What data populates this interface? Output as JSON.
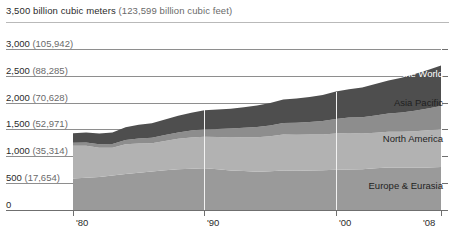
{
  "header": {
    "units_primary": "3,500 billion cubic meters",
    "units_secondary": "(123,599 billion cubic feet)"
  },
  "axis": {
    "y_labels": [
      {
        "value": 3000,
        "text": "3,000",
        "paren": "(105,942)"
      },
      {
        "value": 2500,
        "text": "2,500",
        "paren": "(88,285)"
      },
      {
        "value": 2000,
        "text": "2,000",
        "paren": "(70,628)"
      },
      {
        "value": 1500,
        "text": "1,500",
        "paren": "(52,971)"
      },
      {
        "value": 1000,
        "text": "1,000",
        "paren": "(35,314)"
      },
      {
        "value": 500,
        "text": "500",
        "paren": "(17,654)"
      },
      {
        "value": 0,
        "text": "0",
        "paren": ""
      }
    ],
    "x_labels": [
      {
        "year": 1980,
        "text": "'80"
      },
      {
        "year": 1990,
        "text": "'90"
      },
      {
        "year": 2000,
        "text": "'00"
      },
      {
        "year": 2008,
        "text": "'08"
      }
    ]
  },
  "series_labels": {
    "rest_of_world_line1": "Rest of",
    "rest_of_world_line2": "the World",
    "asia_pacific": "Asia Pacific",
    "north_america": "North America",
    "europe_eurasia": "Europe & Eurasia"
  },
  "colors": {
    "rest_of_world": "#4e4e4e",
    "asia_pacific": "#8d8d8d",
    "north_america": "#b2b2b2",
    "europe_eurasia": "#9a9a9a",
    "gridline": "#8e8e8e",
    "axis": "#6f6f6f",
    "background": "#ffffff"
  },
  "chart_data": {
    "type": "area",
    "title": "3,500 billion cubic meters (123,599 billion cubic feet)",
    "subtitle": "",
    "xlabel": "",
    "ylabel": "billion cubic meters",
    "stacked": true,
    "grid": true,
    "legend": "inline-right",
    "xlim": [
      1980,
      2008
    ],
    "ylim": [
      0,
      3500
    ],
    "yticks": [
      0,
      500,
      1000,
      1500,
      2000,
      2500,
      3000,
      3500
    ],
    "ytick_labels": [
      "0",
      "500 (17,654)",
      "1,000 (35,314)",
      "1,500 (52,971)",
      "2,000 (70,628)",
      "2,500 (88,285)",
      "3,000 (105,942)",
      "3,500 (123,599)"
    ],
    "xticks": [
      1980,
      1990,
      2000,
      2008
    ],
    "xtick_labels": [
      "'80",
      "'90",
      "'00",
      "'08"
    ],
    "x": [
      1980,
      1981,
      1982,
      1983,
      1984,
      1985,
      1986,
      1987,
      1988,
      1989,
      1990,
      1991,
      1992,
      1993,
      1994,
      1995,
      1996,
      1997,
      1998,
      1999,
      2000,
      2001,
      2002,
      2003,
      2004,
      2005,
      2006,
      2007,
      2008
    ],
    "series": [
      {
        "name": "Europe & Eurasia",
        "color": "#9a9a9a",
        "values": [
          585,
          600,
          615,
          640,
          670,
          695,
          715,
          740,
          760,
          770,
          775,
          760,
          735,
          725,
          710,
          720,
          735,
          730,
          735,
          740,
          750,
          755,
          760,
          775,
          790,
          790,
          790,
          790,
          800
        ]
      },
      {
        "name": "North America",
        "color": "#b2b2b2",
        "values": [
          610,
          595,
          545,
          520,
          555,
          545,
          530,
          545,
          565,
          580,
          590,
          600,
          615,
          630,
          645,
          655,
          670,
          670,
          670,
          665,
          675,
          680,
          665,
          665,
          665,
          665,
          675,
          695,
          710
        ]
      },
      {
        "name": "Asia Pacific",
        "color": "#8d8d8d",
        "values": [
          55,
          60,
          65,
          70,
          80,
          90,
          100,
          110,
          120,
          130,
          140,
          150,
          165,
          175,
          190,
          200,
          215,
          225,
          235,
          250,
          270,
          285,
          300,
          320,
          340,
          360,
          385,
          405,
          425
        ]
      },
      {
        "name": "Rest of the World",
        "color": "#4e4e4e",
        "values": [
          180,
          190,
          200,
          215,
          235,
          255,
          270,
          290,
          310,
          330,
          350,
          360,
          370,
          385,
          400,
          415,
          435,
          450,
          465,
          485,
          510,
          530,
          555,
          585,
          615,
          645,
          680,
          715,
          755
        ]
      }
    ],
    "totals": [
      1430,
      1445,
      1425,
      1445,
      1540,
      1585,
      1615,
      1685,
      1755,
      1810,
      1855,
      1870,
      1885,
      1915,
      1945,
      1990,
      2055,
      2075,
      2105,
      2140,
      2205,
      2250,
      2280,
      2345,
      2410,
      2460,
      2530,
      2605,
      2690
    ]
  }
}
